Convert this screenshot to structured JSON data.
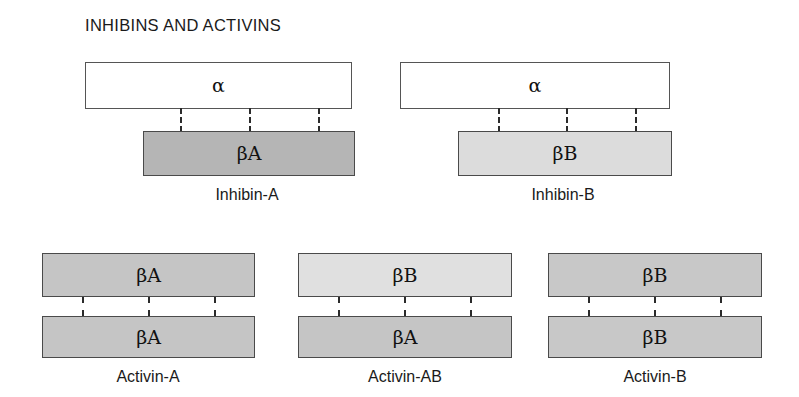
{
  "figure": {
    "title": "INHIBINS AND ACTIVINS",
    "colors": {
      "alpha_fill": "#ffffff",
      "beta_a_dark": "#b5b5b5",
      "beta_a_mid": "#c5c5c5",
      "beta_b_light": "#dcdcdc",
      "beta_b_lighter": "#e0e0e0",
      "beta_b_mid": "#c8c8c8",
      "border": "#4a4a4a",
      "bond": "#2b2b2b",
      "text": "#1a1a1a"
    }
  },
  "inhibins": [
    {
      "id": "inhibin-a",
      "caption": "Inhibin-A",
      "top_subunit": "α",
      "bottom_subunit": "βA",
      "top_fill": "#ffffff",
      "bottom_fill": "#b5b5b5",
      "bond_count": 3
    },
    {
      "id": "inhibin-b",
      "caption": "Inhibin-B",
      "top_subunit": "α",
      "bottom_subunit": "βB",
      "top_fill": "#ffffff",
      "bottom_fill": "#dcdcdc",
      "bond_count": 3
    }
  ],
  "activins": [
    {
      "id": "activin-a",
      "caption": "Activin-A",
      "top_subunit": "βA",
      "bottom_subunit": "βA",
      "top_fill": "#c5c5c5",
      "bottom_fill": "#c5c5c5",
      "bond_count": 3
    },
    {
      "id": "activin-ab",
      "caption": "Activin-AB",
      "top_subunit": "βB",
      "bottom_subunit": "βA",
      "top_fill": "#e0e0e0",
      "bottom_fill": "#c5c5c5",
      "bond_count": 3
    },
    {
      "id": "activin-b",
      "caption": "Activin-B",
      "top_subunit": "βB",
      "bottom_subunit": "βB",
      "top_fill": "#c8c8c8",
      "bottom_fill": "#c8c8c8",
      "bond_count": 3
    }
  ]
}
